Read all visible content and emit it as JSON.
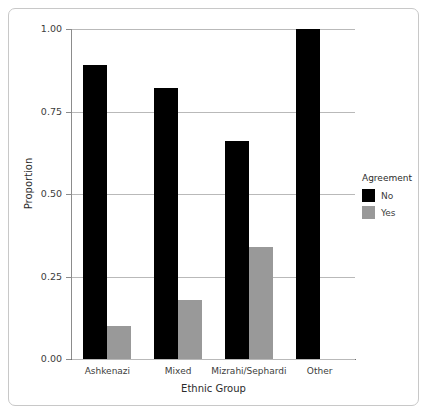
{
  "chart_data": {
    "type": "bar",
    "title": "",
    "subtitle": "",
    "xlabel": "Ethnic Group",
    "ylabel": "Proportion",
    "categories": [
      "Ashkenazi",
      "Mixed",
      "Mizrahi/Sephardi",
      "Other"
    ],
    "series": [
      {
        "name": "No",
        "color": "#000000",
        "values": [
          0.89,
          0.82,
          0.66,
          1.0
        ]
      },
      {
        "name": "Yes",
        "color": "#999999",
        "values": [
          0.1,
          0.18,
          0.34,
          null
        ]
      }
    ],
    "legend": {
      "title": "Agreement",
      "position": "right",
      "entries": [
        {
          "label": "No",
          "color": "#000000"
        },
        {
          "label": "Yes",
          "color": "#999999"
        }
      ]
    },
    "ylim": [
      0.0,
      1.0
    ],
    "ytick_labels": [
      "0.00",
      "0.25",
      "0.50",
      "0.75",
      "1.00"
    ],
    "ytick_values": [
      0.0,
      0.25,
      0.5,
      0.75,
      1.0
    ],
    "grid": true,
    "grid_axis": "y"
  }
}
